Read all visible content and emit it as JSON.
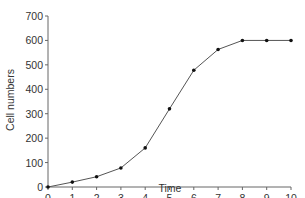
{
  "chart_data": {
    "type": "line",
    "title": "",
    "xlabel": "Time",
    "ylabel": "Cell numbers",
    "x": [
      0,
      1,
      2,
      3,
      4,
      5,
      6,
      7,
      8,
      9,
      10
    ],
    "series": [
      {
        "name": "Cell numbers",
        "values": [
          0,
          20,
          42,
          78,
          160,
          320,
          478,
          563,
          600,
          600,
          600
        ]
      }
    ],
    "xlim": [
      0,
      10
    ],
    "ylim": [
      0,
      700
    ],
    "xticks": [
      "0",
      "1",
      "2",
      "3",
      "4",
      "5",
      "6",
      "7",
      "8",
      "9",
      "10"
    ],
    "yticks": [
      "0",
      "100",
      "200",
      "300",
      "400",
      "500",
      "600",
      "700"
    ],
    "grid": false,
    "legend": "none",
    "colors": {
      "line": "#555555",
      "marker": "#111111",
      "axis": "#666666",
      "text": "#333333"
    }
  }
}
